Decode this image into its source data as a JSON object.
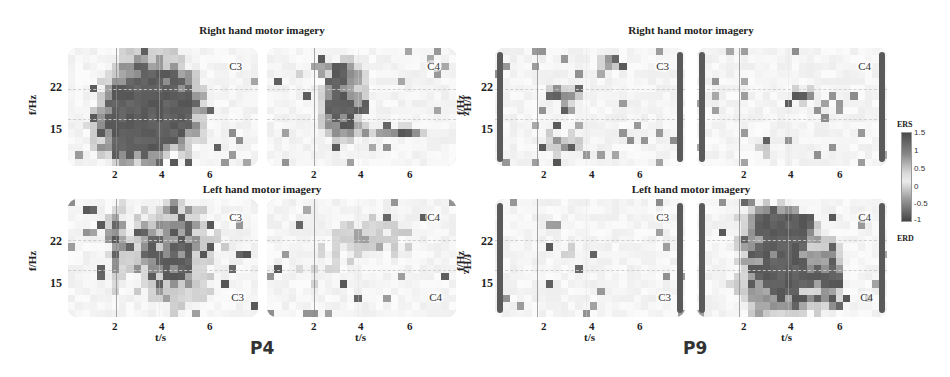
{
  "chart_data": {
    "type": "heatmap",
    "xlabel": "t/s",
    "ylabel": "f/Hz",
    "x_ticks": [
      "2",
      "4",
      "6"
    ],
    "y_ticks": [
      "22",
      "15"
    ],
    "x_range": [
      0,
      8
    ],
    "y_range": [
      8,
      30
    ],
    "colorbar": {
      "top_label": "ERS",
      "bottom_label": "ERD",
      "ticks": [
        "1.5",
        "1",
        "0.5",
        "0",
        "-0.5",
        "-1"
      ],
      "range": [
        -1,
        1.5
      ]
    },
    "subjects": [
      {
        "name": "P4",
        "rows": [
          {
            "title": "Right hand motor imagery",
            "panels": [
              {
                "channel": "C3",
                "pattern": "strong broad ERD 2-5s across 10-28Hz"
              },
              {
                "channel": "C4",
                "pattern": "moderate ERD 2.5-4.5s at 15-25Hz, band at 15Hz 5-7s"
              }
            ]
          },
          {
            "title": "Left hand motor imagery",
            "panels": [
              {
                "channel": "C3",
                "channel_bottom": "C3",
                "pattern": "scattered ERD 3-6.5s"
              },
              {
                "channel": "C4",
                "channel_bottom": "C4",
                "pattern": "sparse patchy ERD"
              }
            ]
          }
        ]
      },
      {
        "name": "P9",
        "rows": [
          {
            "title": "Right hand motor imagery",
            "panels": [
              {
                "channel": "C3",
                "pattern": "sparse ERD patches 2-6s"
              },
              {
                "channel": "C4",
                "pattern": "sparse ERD around 4-5s at 20Hz"
              }
            ]
          },
          {
            "title": "Left hand motor imagery",
            "panels": [
              {
                "channel": "C3",
                "channel_bottom": "C3",
                "pattern": "mostly neutral, few patches"
              },
              {
                "channel": "C4",
                "channel_bottom": "C4",
                "pattern": "strong broad ERD 1.5-5s across 10-28Hz"
              }
            ]
          }
        ]
      }
    ]
  },
  "labels": {
    "p4_top_title": "Right hand motor imagery",
    "p4_bottom_title": "Left hand motor imagery",
    "p9_top_title": "Right hand motor imagery",
    "p9_bottom_title": "Left hand motor imagery",
    "ylabel": "f/Hz",
    "xlabel": "t/s",
    "ytick_22": "22",
    "ytick_15": "15",
    "xtick_2": "2",
    "xtick_4": "4",
    "xtick_6": "6",
    "c3": "C3",
    "c4": "C4",
    "subject_p4": "P4",
    "subject_p9": "P9",
    "cb_ers": "ERS",
    "cb_erd": "ERD",
    "cb_t1": "1.5",
    "cb_t2": "1",
    "cb_t3": "0.5",
    "cb_t4": "0",
    "cb_t5": "-0.5",
    "cb_t6": "-1"
  }
}
